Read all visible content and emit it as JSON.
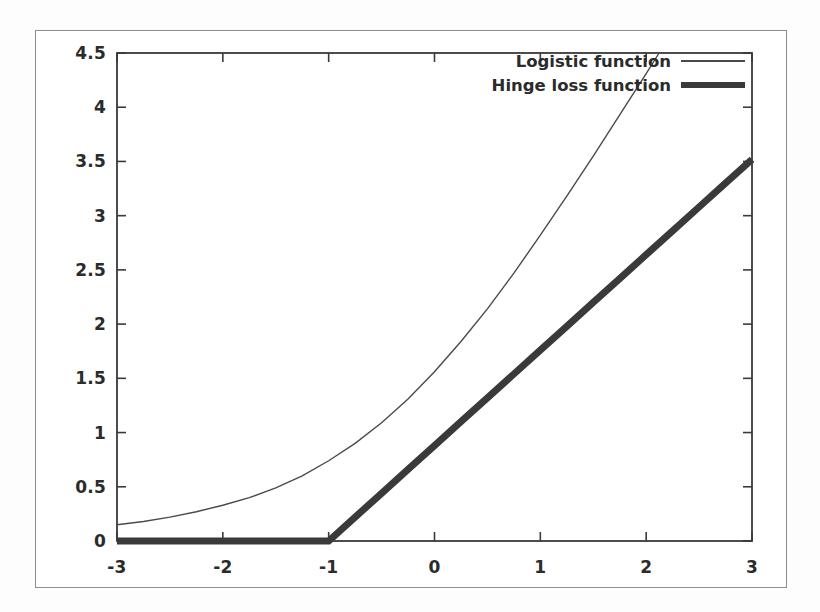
{
  "figure": {
    "background_color": "#ffffff",
    "frame_color": "#8d8d8d",
    "axis_color": "#3a3a3a"
  },
  "legend": {
    "position": "top-right-inside",
    "entries": [
      {
        "label": "Logistic function",
        "style": "thin-line",
        "color": "#4a4a4a"
      },
      {
        "label": "Hinge loss function",
        "style": "thick-line",
        "color": "#3a3a3a"
      }
    ]
  },
  "axes": {
    "x_tick_labels": [
      "-3",
      "-2",
      "-1",
      "0",
      "1",
      "2",
      "3"
    ],
    "y_tick_labels": [
      "0",
      "0.5",
      "1",
      "1.5",
      "2",
      "2.5",
      "3",
      "3.5",
      "4",
      "4.5"
    ]
  },
  "chart_data": {
    "type": "line",
    "title": "",
    "subtitle": "",
    "xlabel": "",
    "ylabel": "",
    "xlim": [
      -3,
      3
    ],
    "ylim": [
      0,
      4.5
    ],
    "xticks": [
      -3,
      -2,
      -1,
      0,
      1,
      2,
      3
    ],
    "yticks": [
      0,
      0.5,
      1,
      1.5,
      2,
      2.5,
      3,
      3.5,
      4,
      4.5
    ],
    "grid": false,
    "legend_position": "upper right",
    "x": [
      -3,
      -2.75,
      -2.5,
      -2.25,
      -2,
      -1.75,
      -1.5,
      -1.25,
      -1,
      -0.75,
      -0.5,
      -0.25,
      0,
      0.25,
      0.5,
      0.75,
      1,
      1.25,
      1.5,
      1.75,
      2,
      2.25,
      2.5,
      2.75,
      3
    ],
    "series": [
      {
        "name": "Logistic function",
        "style": "thin-line",
        "color": "#4a4a4a",
        "linewidth": 1.4,
        "values": [
          0.15,
          0.18,
          0.22,
          0.27,
          0.33,
          0.4,
          0.49,
          0.6,
          0.74,
          0.9,
          1.09,
          1.31,
          1.56,
          1.84,
          2.14,
          2.47,
          2.82,
          3.18,
          3.55,
          3.93,
          4.31,
          4.7,
          5.09,
          5.48,
          5.87
        ]
      },
      {
        "name": "Hinge loss function",
        "style": "thick-line",
        "color": "#3a3a3a",
        "linewidth": 7,
        "values": [
          0,
          0,
          0,
          0,
          0,
          0,
          0,
          0,
          0,
          0.22,
          0.44,
          0.66,
          0.88,
          1.1,
          1.32,
          1.54,
          1.76,
          1.98,
          2.2,
          2.42,
          2.64,
          2.86,
          3.08,
          3.3,
          3.52
        ]
      }
    ],
    "annotations": [
      {
        "text": "hinge kink at x = -1, y = 0"
      },
      {
        "text": "logistic curve ends near y = 4.05 at x = 3"
      },
      {
        "text": "hinge line ends near y = 3.52 at x = 3"
      }
    ]
  }
}
